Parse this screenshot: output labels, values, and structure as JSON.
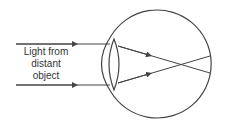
{
  "diagram": {
    "label_lines": [
      "Light from",
      "distant",
      "object"
    ],
    "stroke_color": "#444444",
    "background": "#ffffff"
  }
}
